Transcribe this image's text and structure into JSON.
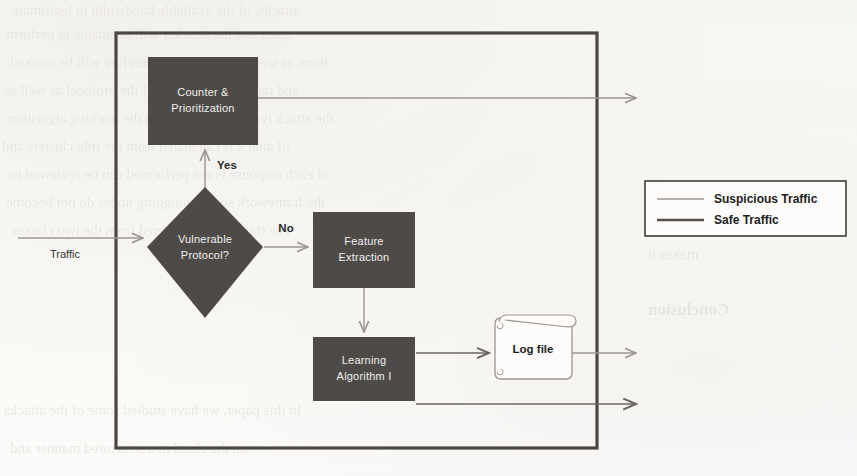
{
  "diagram": {
    "colors": {
      "node_fill": "#4d4a48",
      "node_text": "#f2f0ed",
      "border": "#4a4744",
      "suspicious_line": "#9b9692",
      "safe_line": "#55514e",
      "paper": "#fbfaf8"
    },
    "nodes": [
      {
        "id": "counter",
        "label_line1": "Counter &",
        "label_line2": "Prioritization",
        "shape": "rect"
      },
      {
        "id": "decision",
        "label_line1": "Vulnerable",
        "label_line2": "Protocol?",
        "shape": "diamond"
      },
      {
        "id": "feature",
        "label_line1": "Feature",
        "label_line2": "Extraction",
        "shape": "rect"
      },
      {
        "id": "learning",
        "label_line1": "Learning",
        "label_line2": "Algorithm I",
        "shape": "rect"
      },
      {
        "id": "logfile",
        "label_line1": "Log file",
        "shape": "document"
      }
    ],
    "edge_labels": {
      "yes": "Yes",
      "no": "No",
      "input": "Traffic"
    }
  },
  "legend": {
    "items": [
      {
        "label": "Suspicious Traffic",
        "line_color": "#9b9692"
      },
      {
        "label": "Safe Traffic",
        "line_color": "#55514e"
      }
    ]
  },
  "background_text": {
    "note": "faint bleed-through text from reverse side of scanned page",
    "lines": [
      "attacks, of the available bandwidth to legitimate",
      "users and the attacker will be unable to perform",
      "them as well, DDoS attacks therefore will be marked",
      "and ranked on the basis of the protocol as well as",
      "the attack type and classified in the learning algorithm",
      "of attack is calculated from the rule clusters and",
      "of each response is not performed can be reviewed to",
      "the framework so that outgoing nodes do not become",
      "The traffic is then filtered from the two classes",
      "makes it",
      "Conclusion",
      "In this paper, we have studied some of the attacks",
      "on the cloud in a structured manner and"
    ]
  }
}
